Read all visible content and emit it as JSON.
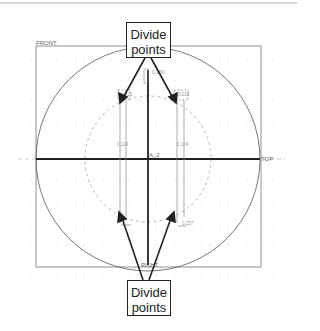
{
  "diagram": {
    "type": "cad-sketch",
    "datum_labels": {
      "front": "FRONT",
      "top": "TOP",
      "right": "RIGHT",
      "center": "A_2"
    },
    "dimensions": {
      "top_center": "0.250",
      "upper_left": "0.22",
      "upper_right": "0.220",
      "mid_left": "0.124",
      "mid_right": "0.124",
      "lower_right": "0.257"
    },
    "callouts": [
      {
        "line1": "Divide",
        "line2": "points",
        "position": "top"
      },
      {
        "line1": "Divide",
        "line2": "points",
        "position": "bottom"
      }
    ],
    "colors": {
      "ink": "#222222",
      "sketch_line": "#777777",
      "dashed": "#aaaaaa",
      "grid": "#dddddd"
    }
  }
}
